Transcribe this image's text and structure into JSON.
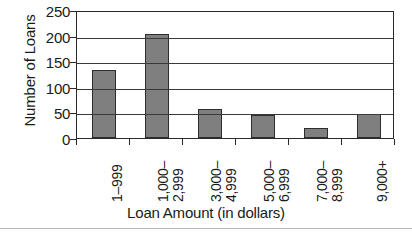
{
  "chart_data": {
    "type": "bar",
    "title": "",
    "xlabel": "Loan Amount (in dollars)",
    "ylabel": "Number of Loans",
    "categories": [
      "1–999",
      "1,000–2,999",
      "3,000–4,999",
      "5,000–6,999",
      "7,000–8,999",
      "9,000+"
    ],
    "category_lines": [
      [
        "1–999"
      ],
      [
        "1,000–",
        "2,999"
      ],
      [
        "3,000–",
        "4,999"
      ],
      [
        "5,000–",
        "6,999"
      ],
      [
        "7,000–",
        "8,999"
      ],
      [
        "9,000+"
      ]
    ],
    "values": [
      133,
      204,
      57,
      45,
      20,
      46
    ],
    "ylim": [
      0,
      250
    ],
    "yticks": [
      0,
      50,
      100,
      150,
      200,
      250
    ],
    "ytick_labels": [
      "0",
      "50",
      "100",
      "150",
      "200",
      "250"
    ],
    "grid": "horizontal",
    "legend": "none",
    "bar_color": "#807f7f",
    "bar_edge_color": "#2d2d2d",
    "axis_color": "#2a2a2a",
    "background": "#ffffff"
  },
  "caption": {
    "text": ""
  }
}
